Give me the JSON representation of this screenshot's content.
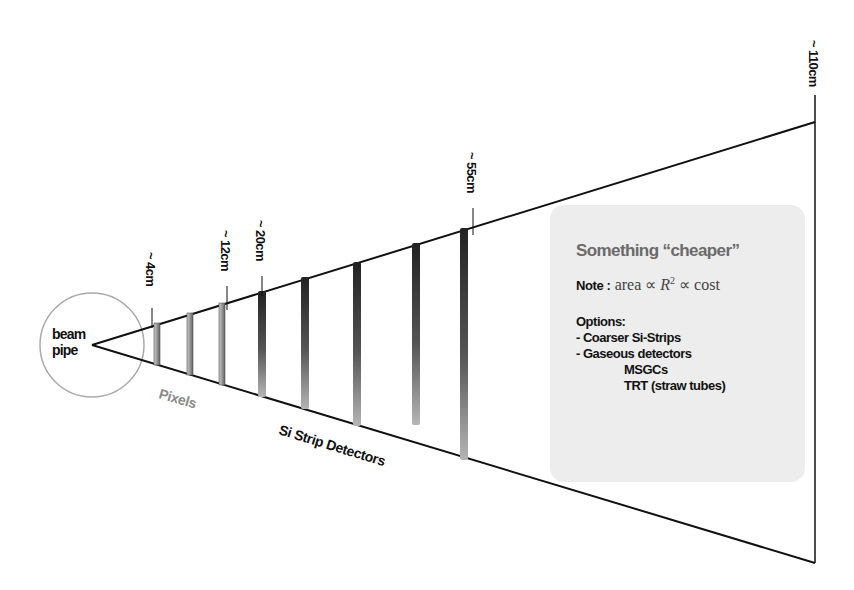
{
  "diagram": {
    "beam_pipe": {
      "label_line1": "beam",
      "label_line2": "pipe"
    },
    "radius_markers": [
      {
        "label": "~ 4cm",
        "x": 152
      },
      {
        "label": "~ 12cm",
        "x": 227
      },
      {
        "label": "~ 20cm",
        "x": 262
      },
      {
        "label": "~ 55cm",
        "x": 473
      },
      {
        "label": "~ 110cm",
        "x": 815
      }
    ],
    "detector_layers": [
      {
        "x": 157,
        "group": "pixel"
      },
      {
        "x": 190,
        "group": "pixel"
      },
      {
        "x": 222,
        "group": "pixel"
      },
      {
        "x": 262,
        "group": "strip"
      },
      {
        "x": 305,
        "group": "strip"
      },
      {
        "x": 357,
        "group": "strip"
      },
      {
        "x": 416,
        "group": "strip"
      },
      {
        "x": 464,
        "group": "strip"
      }
    ],
    "region_labels": {
      "pixels": "Pixels",
      "strips": "Si Strip Detectors"
    },
    "colors": {
      "line": "#111111",
      "pixel_label": "#8a8a8a",
      "box_bg": "#ededed",
      "title_gray": "#6a6a6a"
    }
  },
  "note_box": {
    "title": "Something “cheaper”",
    "note_label": "Note",
    "note_colon": " :",
    "note_formula_pre": "area ∝ ",
    "note_formula_var": "R",
    "note_formula_exp": "2",
    "note_formula_post": " ∝ cost",
    "options_heading": "Options:",
    "options": [
      "- Coarser Si-Strips",
      "- Gaseous detectors"
    ],
    "sub_options": [
      "MSGCs",
      "TRT (straw tubes)"
    ]
  }
}
